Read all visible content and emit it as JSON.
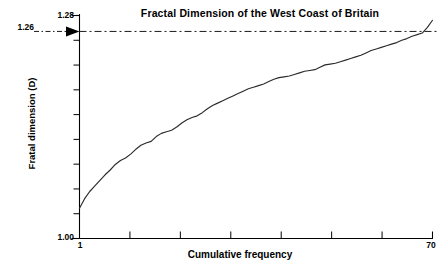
{
  "chart_data": {
    "type": "line",
    "title": "Fractal Dimension of the West Coast of Britain",
    "xlabel": "Cumulative frequency",
    "ylabel": "Fratal dimension (D)",
    "xlim": [
      1,
      70
    ],
    "ylim": [
      1.0,
      1.28
    ],
    "grid": false,
    "legend": "none",
    "x_tick_labels": [
      "1",
      "70"
    ],
    "y_tick_labels": [
      "1.00",
      "1.28"
    ],
    "y_minor_tick_count": 8,
    "x_minor_tick_count": 7,
    "annotations": [
      {
        "name": "reference-line-1.26",
        "label": "1.26",
        "value": 1.26,
        "style": "dash-dot",
        "arrow": true,
        "description": "Horizontal dash-dot reference line at fractal dimension 1.26 with leader arrow"
      }
    ],
    "series": [
      {
        "name": "Cumulative fractal dimension ogive",
        "color": "#2b2b2b",
        "x": [
          1,
          2,
          3,
          4,
          5,
          6,
          7,
          8,
          9,
          10,
          11,
          12,
          13,
          14,
          15,
          16,
          17,
          18,
          19,
          20,
          21,
          22,
          23,
          24,
          25,
          26,
          27,
          28,
          29,
          30,
          31,
          32,
          33,
          34,
          35,
          36,
          37,
          38,
          39,
          40,
          41,
          42,
          43,
          44,
          45,
          46,
          47,
          48,
          49,
          50,
          51,
          52,
          53,
          54,
          55,
          56,
          57,
          58,
          59,
          60,
          61,
          62,
          63,
          64,
          65,
          66,
          67,
          68,
          69,
          70
        ],
        "y": [
          1.038,
          1.05,
          1.059,
          1.066,
          1.073,
          1.08,
          1.086,
          1.093,
          1.098,
          1.101,
          1.106,
          1.112,
          1.117,
          1.12,
          1.122,
          1.128,
          1.132,
          1.134,
          1.136,
          1.14,
          1.145,
          1.149,
          1.152,
          1.154,
          1.158,
          1.163,
          1.167,
          1.17,
          1.173,
          1.176,
          1.179,
          1.182,
          1.185,
          1.188,
          1.19,
          1.192,
          1.194,
          1.197,
          1.2,
          1.202,
          1.203,
          1.204,
          1.206,
          1.208,
          1.21,
          1.211,
          1.212,
          1.215,
          1.218,
          1.219,
          1.22,
          1.222,
          1.224,
          1.226,
          1.228,
          1.23,
          1.233,
          1.236,
          1.238,
          1.24,
          1.242,
          1.244,
          1.246,
          1.249,
          1.251,
          1.254,
          1.256,
          1.258,
          1.265,
          1.274
        ]
      }
    ]
  },
  "axes": {
    "y_top_label": "1.28",
    "y_bottom_label": "1.00",
    "y_ref_label": "1.26",
    "x_first_label": "1",
    "x_last_label": "70",
    "x_title": "Cumulative frequency",
    "y_title": "Fratal dimension (D)"
  },
  "figure": {
    "title": "Fractal Dimension of the West Coast of Britain",
    "line_color": "#2b2b2b",
    "axis_color": "#000000",
    "background": "#ffffff"
  }
}
